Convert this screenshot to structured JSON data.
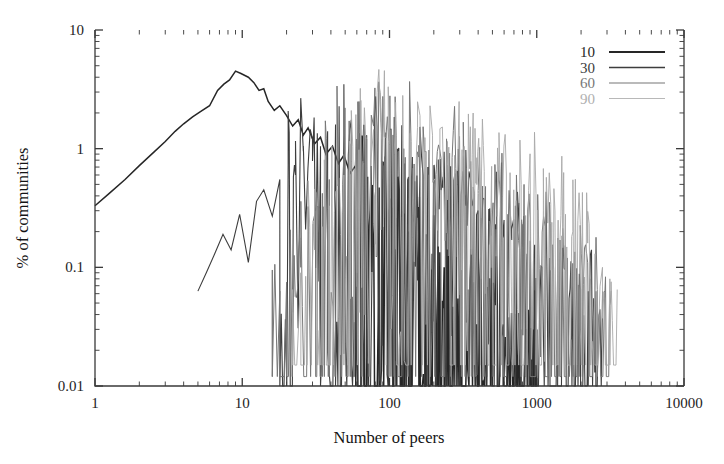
{
  "chart_data": {
    "type": "line",
    "title": "",
    "xlabel": "Number of peers",
    "ylabel": "% of communities",
    "xscale": "log",
    "yscale": "log",
    "xlim": [
      1,
      10000
    ],
    "ylim": [
      0.01,
      10
    ],
    "xticks": [
      "1",
      "10",
      "100",
      "1000",
      "10000"
    ],
    "yticks": [
      "0.01",
      "0.1",
      "1",
      "10"
    ],
    "grid": false,
    "legend_position": "top-right",
    "legend_entries": [
      "10",
      "30",
      "60",
      "90"
    ],
    "series": [
      {
        "name": "10",
        "color": "#262626",
        "width": 1.5,
        "x": [
          1,
          1.25,
          1.6,
          2,
          2.5,
          3,
          3.5,
          4,
          4.6,
          5.2,
          6,
          6.8,
          7.5,
          8.2,
          9,
          9.8,
          11,
          12,
          13,
          14,
          15,
          16.5,
          18,
          20,
          22,
          24,
          26,
          28,
          31,
          34,
          37,
          41,
          45,
          49,
          54,
          59,
          65,
          71,
          78,
          85,
          93,
          102,
          112,
          123,
          135,
          148,
          162,
          178,
          195,
          214,
          235,
          258,
          283,
          310,
          340,
          373,
          409,
          449,
          492,
          540,
          592,
          650,
          713,
          782,
          858,
          941,
          1000
        ],
        "y": [
          0.33,
          0.42,
          0.55,
          0.72,
          0.93,
          1.15,
          1.4,
          1.62,
          1.85,
          2.05,
          2.3,
          3.1,
          3.5,
          3.8,
          4.5,
          4.3,
          4.0,
          3.6,
          3.1,
          3.2,
          2.5,
          2.1,
          2.3,
          1.9,
          1.55,
          1.75,
          1.3,
          1.5,
          1.1,
          1.25,
          0.9,
          1.05,
          0.75,
          0.88,
          0.62,
          0.72,
          0.5,
          0.58,
          0.4,
          0.47,
          0.33,
          0.38,
          0.26,
          0.3,
          0.2,
          0.24,
          0.16,
          0.19,
          0.13,
          0.15,
          0.1,
          0.12,
          0.08,
          0.095,
          0.065,
          0.075,
          0.05,
          0.06,
          0.04,
          0.048,
          0.033,
          0.038,
          0.03,
          0.03,
          0.03,
          0.03,
          0.03
        ],
        "noise_start": 60,
        "floor": 0.01,
        "plateau_value": 0.03,
        "plateau_end": 1000
      },
      {
        "name": "30",
        "color": "#3d3d3d",
        "width": 1.1,
        "x": [
          5,
          5.7,
          6.5,
          7.4,
          8.4,
          9.6,
          11,
          12.5,
          14,
          16,
          18,
          20.5,
          23,
          26,
          30,
          34,
          38,
          43,
          49,
          55,
          62,
          70,
          79,
          89,
          100,
          113,
          127,
          143,
          161,
          182,
          205,
          231,
          260,
          293,
          330,
          372,
          419,
          472,
          532,
          600,
          676,
          762,
          859,
          968,
          1091,
          1230,
          1386,
          1562,
          1760,
          1984,
          2236,
          2520,
          2800
        ],
        "y": [
          0.063,
          0.09,
          0.13,
          0.19,
          0.14,
          0.28,
          0.11,
          0.36,
          0.45,
          0.27,
          0.55,
          0.75,
          0.6,
          0.95,
          1.2,
          1.05,
          1.4,
          1.6,
          1.3,
          1.75,
          1.45,
          1.3,
          1.05,
          1.2,
          0.9,
          1.0,
          0.75,
          0.85,
          0.6,
          0.7,
          0.5,
          0.58,
          0.4,
          0.47,
          0.33,
          0.38,
          0.26,
          0.31,
          0.21,
          0.25,
          0.17,
          0.2,
          0.13,
          0.155,
          0.1,
          0.12,
          0.085,
          0.095,
          0.07,
          0.065,
          0.063,
          0.063,
          0.063
        ],
        "noise_start": 20,
        "floor": 0.01,
        "plateau_value": 0.063,
        "plateau_end": 2800
      },
      {
        "name": "60",
        "color": "#777777",
        "width": 1.0,
        "x": [
          16,
          18,
          20,
          22.5,
          25,
          28,
          31.5,
          35,
          39,
          44,
          49,
          55,
          62,
          70,
          78,
          88,
          99,
          111,
          125,
          140,
          158,
          177,
          199,
          224,
          251,
          282,
          317,
          356,
          400,
          449,
          505,
          567,
          637,
          716,
          804,
          903,
          1015,
          1140,
          1281,
          1439,
          1617,
          1816,
          2041,
          2293,
          2576,
          2894,
          3200
        ],
        "y": [
          0.095,
          0.063,
          0.075,
          0.12,
          0.1,
          0.2,
          0.3,
          0.42,
          0.55,
          0.7,
          0.9,
          1.1,
          1.35,
          1.2,
          1.55,
          1.35,
          1.15,
          1.3,
          1.0,
          1.15,
          0.85,
          0.95,
          0.72,
          0.82,
          0.6,
          0.68,
          0.5,
          0.57,
          0.42,
          0.48,
          0.35,
          0.4,
          0.28,
          0.33,
          0.23,
          0.26,
          0.19,
          0.22,
          0.15,
          0.17,
          0.12,
          0.135,
          0.095,
          0.08,
          0.065,
          0.063,
          0.063
        ],
        "noise_start": 16,
        "floor": 0.012,
        "plateau_value": 0.063,
        "plateau_end": 3200
      },
      {
        "name": "90",
        "color": "#a8a8a8",
        "width": 0.9,
        "x": [
          22,
          25,
          28,
          31,
          35,
          39,
          44,
          49,
          55,
          62,
          69,
          78,
          87,
          98,
          110,
          123,
          138,
          155,
          174,
          196,
          220,
          247,
          277,
          311,
          349,
          392,
          440,
          494,
          554,
          622,
          698,
          784,
          880,
          988,
          1109,
          1245,
          1397,
          1568,
          1760,
          1976,
          2218,
          2490,
          2795,
          3137,
          3520
        ],
        "y": [
          0.065,
          0.09,
          0.075,
          0.14,
          0.22,
          0.33,
          0.45,
          0.6,
          0.78,
          0.98,
          1.2,
          1.45,
          1.7,
          1.5,
          1.8,
          1.55,
          1.35,
          1.5,
          1.2,
          1.3,
          1.05,
          1.15,
          0.88,
          0.98,
          0.75,
          0.84,
          0.64,
          0.71,
          0.54,
          0.6,
          0.45,
          0.5,
          0.37,
          0.42,
          0.3,
          0.34,
          0.25,
          0.28,
          0.2,
          0.23,
          0.16,
          0.13,
          0.1,
          0.08,
          0.065
        ],
        "noise_start": 14,
        "floor": 0.015,
        "plateau_value": 0.065,
        "plateau_end": 3520
      }
    ]
  },
  "legend": {
    "items": [
      {
        "label": "10",
        "color": "#262626",
        "width": 2.0
      },
      {
        "label": "30",
        "color": "#3d3d3d",
        "width": 1.5
      },
      {
        "label": "60",
        "color": "#777777",
        "width": 1.1
      },
      {
        "label": "90",
        "color": "#b0b0b0",
        "width": 0.9
      }
    ]
  },
  "axes": {
    "x_title": "Number of peers",
    "y_title": "% of communities"
  }
}
